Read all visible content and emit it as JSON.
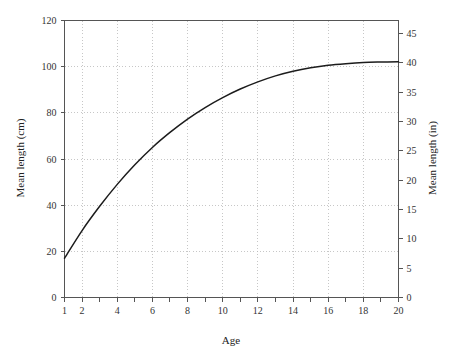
{
  "chart_data": {
    "type": "line",
    "title": "",
    "subtitle": "",
    "xlabel": "Age",
    "ylabel": "Mean length (cm)",
    "y2label": "Mean length (in)",
    "xlim": [
      1,
      20
    ],
    "ylim": [
      0,
      120
    ],
    "y2lim": [
      0,
      47.24
    ],
    "grid": true,
    "legend": null,
    "x_ticks": [
      1,
      2,
      3,
      4,
      5,
      6,
      7,
      8,
      9,
      10,
      11,
      12,
      13,
      14,
      15,
      16,
      17,
      18,
      19,
      20
    ],
    "x_tick_labels": [
      "1",
      "2",
      "",
      "4",
      "",
      "6",
      "",
      "8",
      "",
      "10",
      "",
      "12",
      "",
      "14",
      "",
      "16",
      "",
      "18",
      "",
      "20"
    ],
    "y_ticks": [
      0,
      20,
      40,
      60,
      80,
      100,
      120
    ],
    "y_tick_labels": [
      "0",
      "20",
      "40",
      "60",
      "80",
      "100",
      "120"
    ],
    "y2_ticks": [
      0,
      5,
      10,
      15,
      20,
      25,
      30,
      35,
      40,
      45
    ],
    "y2_tick_labels": [
      "0",
      "5",
      "10",
      "15",
      "20",
      "25",
      "30",
      "35",
      "40",
      "45"
    ],
    "x_gridlines": [
      2,
      4,
      6,
      8,
      10,
      12,
      14,
      16,
      18,
      20
    ],
    "y_gridlines": [
      20,
      40,
      60,
      80,
      100
    ],
    "series": [
      {
        "name": "Mean length",
        "color": "#1c1c1c",
        "x": [
          1,
          2,
          3,
          4,
          5,
          6,
          7,
          8,
          9,
          10,
          11,
          12,
          13,
          14,
          15,
          16,
          17,
          18,
          19,
          20
        ],
        "values": [
          17.0,
          29.0,
          39.5,
          49.0,
          57.5,
          65.0,
          71.5,
          77.3,
          82.3,
          86.6,
          90.3,
          93.4,
          96.0,
          98.0,
          99.5,
          100.6,
          101.3,
          101.8,
          102.0,
          102.1
        ]
      }
    ]
  },
  "axes": {
    "left_title": "Mean length (cm)",
    "right_title": "Mean length (in)",
    "bottom_title": "Age"
  },
  "colors": {
    "curve": "#1c1c1c",
    "frame": "#555555",
    "grid": "#b9b9b9",
    "text": "#222222",
    "background": "#ffffff"
  }
}
